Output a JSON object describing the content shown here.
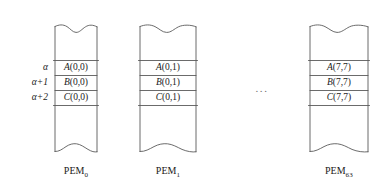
{
  "figure": {
    "type": "memory-layout-diagram",
    "ellipsis": "...",
    "stroke_color": "#5a5a5a",
    "text_color": "#1a1a1a",
    "background_color": "#ffffff"
  },
  "row_index_labels": [
    {
      "text": "α"
    },
    {
      "text": "α+1"
    },
    {
      "text": "α+2"
    }
  ],
  "columns": [
    {
      "caption_base": "PEM",
      "caption_subscript": "0",
      "cells": [
        {
          "name": "A",
          "args": "(0,0)"
        },
        {
          "name": "B",
          "args": "(0,0)"
        },
        {
          "name": "C",
          "args": "(0,0)"
        }
      ]
    },
    {
      "caption_base": "PEM",
      "caption_subscript": "1",
      "cells": [
        {
          "name": "A",
          "args": "(0,1)"
        },
        {
          "name": "B",
          "args": "(0,1)"
        },
        {
          "name": "C",
          "args": "(0,1)"
        }
      ]
    },
    {
      "caption_base": "PEM",
      "caption_subscript": "63",
      "cells": [
        {
          "name": "A",
          "args": "(7,7)"
        },
        {
          "name": "B",
          "args": "(7,7)"
        },
        {
          "name": "C",
          "args": "(7,7)"
        }
      ]
    }
  ]
}
